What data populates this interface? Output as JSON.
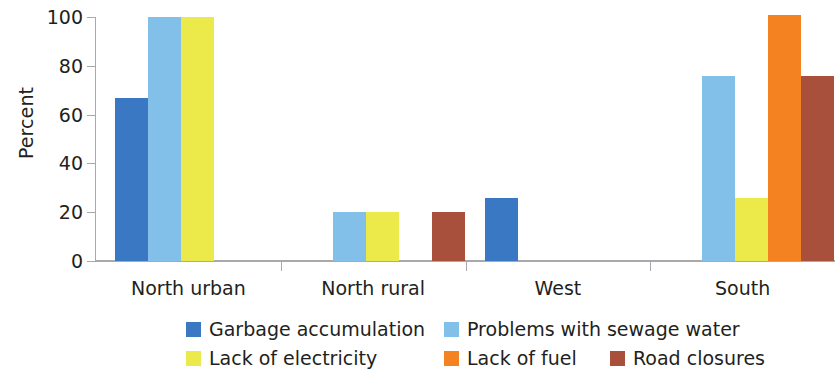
{
  "chart_data": {
    "type": "bar",
    "title": "",
    "xlabel": "",
    "ylabel": "Percent",
    "ylim": [
      0,
      100
    ],
    "yticks": [
      0,
      20,
      40,
      60,
      80,
      100
    ],
    "grid": false,
    "legend_position": "bottom",
    "categories": [
      "North urban",
      "North rural",
      "West",
      "South"
    ],
    "series": [
      {
        "name": "Garbage accumulation",
        "color": "#3b78c3",
        "values": [
          67,
          null,
          26,
          null
        ]
      },
      {
        "name": "Problems with sewage water",
        "color": "#82c0e9",
        "values": [
          100,
          20,
          null,
          76
        ]
      },
      {
        "name": "Lack of electricity",
        "color": "#ecea4b",
        "values": [
          100,
          20,
          null,
          26
        ]
      },
      {
        "name": "Lack of fuel",
        "color": "#f58220",
        "values": [
          null,
          null,
          null,
          101
        ]
      },
      {
        "name": "Road closures",
        "color": "#a8503b",
        "values": [
          null,
          20,
          null,
          76
        ]
      }
    ]
  },
  "axis": {
    "y_title": "Percent",
    "y_tick_labels": [
      "0",
      "20",
      "40",
      "60",
      "80",
      "100"
    ],
    "x_tick_labels": [
      "North urban",
      "North rural",
      "West",
      "South"
    ]
  },
  "legend": {
    "items": [
      {
        "label": "Garbage accumulation",
        "color": "#3b78c3"
      },
      {
        "label": "Problems with sewage water",
        "color": "#82c0e9"
      },
      {
        "label": "Lack of electricity",
        "color": "#ecea4b"
      },
      {
        "label": "Lack of fuel",
        "color": "#f58220"
      },
      {
        "label": "Road closures",
        "color": "#a8503b"
      }
    ]
  }
}
